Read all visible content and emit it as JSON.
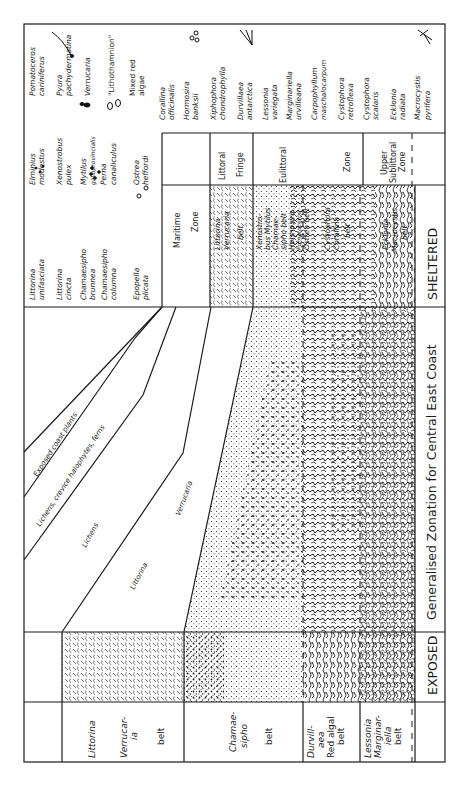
{
  "figure": {
    "title": "Generalised Zonation for Central East Coast",
    "exposure_labels": {
      "sheltered": "SHELTERED",
      "exposed": "EXPOSED"
    },
    "diagonal_zones": [
      {
        "label": "Exposed coast plants"
      },
      {
        "label": "Lichens, crevice halophytes, ferns"
      },
      {
        "label": "Lichens"
      },
      {
        "label": "Littorina"
      },
      {
        "label": "Verrucaria"
      }
    ],
    "zone_table": {
      "maritime": [
        "Maritime",
        "Zone"
      ],
      "littoral_fringe": [
        "Littoral",
        "Fringe"
      ],
      "eulittoral": [
        "Eulittoral",
        "Zone"
      ],
      "upper_sublittoral": [
        "Upper",
        "Sublittoral",
        "Zone"
      ]
    },
    "sheltered_belts": [
      {
        "lines": [
          "Littorina",
          "Verrucaria",
          "belt"
        ]
      },
      {
        "lines": [
          "Xenostro-",
          "bus Mytilus",
          "Chamae-",
          "sipho belt",
          "Hormosira",
          "Pomatoceros",
          "Ostrea belt"
        ]
      },
      {
        "lines": [
          "Cystophora",
          "Corallina",
          "belt"
        ]
      },
      {
        "lines": [
          "Ecklonia",
          "Macrocystis",
          "belt"
        ]
      }
    ],
    "exposed_belts": [
      {
        "lines": [
          "Littorina",
          "Verrucar-",
          "ia",
          "belt"
        ]
      },
      {
        "lines": [
          "Chamae-",
          "sipho",
          "belt"
        ]
      },
      {
        "lines": [
          "Durvill-",
          "aea",
          "Red algal",
          "belt"
        ]
      },
      {
        "lines": [
          "Lessonia",
          "Marginar-",
          "iella",
          "belt"
        ]
      }
    ],
    "legend": {
      "animals": [
        {
          "name": [
            "Littorina",
            "unifasciata"
          ]
        },
        {
          "name": [
            "Littorina",
            "cincta"
          ]
        },
        {
          "name": [
            "Chamaesipho",
            "brunnea"
          ]
        },
        {
          "name": [
            "Chamaesipho",
            "columna"
          ]
        },
        {
          "name": [
            "Epopella",
            "plicata"
          ]
        },
        {
          "name": [
            "Elminius",
            "modestus"
          ]
        },
        {
          "name": [
            "Xenostrobus",
            "pulex"
          ]
        },
        {
          "name": [
            "Mytilus",
            "galloprovincialis"
          ]
        },
        {
          "name": [
            "Perna",
            "canaliculus"
          ]
        },
        {
          "name": [
            "Ostrea",
            "heffordi"
          ]
        },
        {
          "name": [
            "Pomatoceros",
            "cariniferus"
          ]
        },
        {
          "name": [
            "Pyura",
            "pachydermatina"
          ]
        },
        {
          "name": [
            "Verrucaria",
            ""
          ]
        },
        {
          "name": [
            "\"Lithothamnion\"",
            ""
          ]
        },
        {
          "name": [
            "Mixed red",
            "algae"
          ]
        }
      ],
      "algae": [
        {
          "name": [
            "Corallina",
            "officinalis"
          ]
        },
        {
          "name": [
            "Hormosira",
            "banksii"
          ]
        },
        {
          "name": [
            "Xiphophora",
            "chondrophylla"
          ]
        },
        {
          "name": [
            "Durvillaea",
            "antarctica"
          ]
        },
        {
          "name": [
            "Lessonia",
            "variegata"
          ]
        },
        {
          "name": [
            "Marginariella",
            "urvilleana"
          ]
        },
        {
          "name": [
            "Carpophyllum",
            "maschalocarpum"
          ]
        },
        {
          "name": [
            "Cystophora",
            "retroflexa"
          ]
        },
        {
          "name": [
            "Cystophora",
            "scalaris"
          ]
        },
        {
          "name": [
            "Ecklonia",
            "radiata"
          ]
        },
        {
          "name": [
            "Macrocystis",
            "pyrifera"
          ]
        }
      ]
    },
    "colors": {
      "ink": "#1a1a1a",
      "paper": "#ffffff"
    }
  }
}
